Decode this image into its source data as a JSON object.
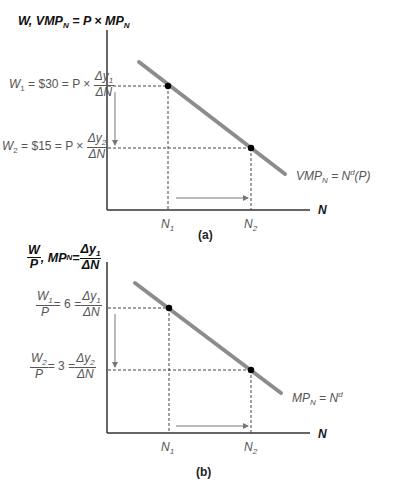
{
  "panel_a": {
    "y_axis_title": {
      "w": "W, VMP",
      "n_sub": "N",
      "eq": " = P × MP",
      "n_sub2": "N"
    },
    "w1_label": {
      "w": "W",
      "sub": "1",
      "rest": " = $30 = P × ",
      "num_a": "Δy",
      "num_sub": "1",
      "den": "ΔN"
    },
    "w2_label": {
      "w": "W",
      "sub": "2",
      "rest": " = $15 = P × ",
      "num_a": "Δy",
      "num_sub": "2",
      "den": "ΔN"
    },
    "curve_label": {
      "a": "VMP",
      "sub": "N",
      "b": " = N",
      "sup": "d",
      "c": "(P)"
    },
    "x_axis_label": "N",
    "n1": {
      "n": "N",
      "sub": "1"
    },
    "n2": {
      "n": "N",
      "sub": "2"
    },
    "caption": "(a)"
  },
  "panel_b": {
    "y_axis_title": {
      "frac_num": "W",
      "frac_den": "P",
      "mid": " , MP",
      "n_sub": "N",
      "eq": " = ",
      "num_a": "Δy",
      "num_sub": "1",
      "den": "ΔN"
    },
    "w1_label": {
      "frac_num_w": "W",
      "frac_num_sub": "1",
      "frac_den": "P",
      "rest": " = 6 = ",
      "num_a": "Δy",
      "num_sub": "1",
      "den": "ΔN"
    },
    "w2_label": {
      "frac_num_w": "W",
      "frac_num_sub": "2",
      "frac_den": "P",
      "rest": " = 3 = ",
      "num_a": "Δy",
      "num_sub": "2",
      "den": "ΔN"
    },
    "curve_label": {
      "a": "MP",
      "sub": "N",
      "b": " = N",
      "sup": "d"
    },
    "x_axis_label": "N",
    "n1": {
      "n": "N",
      "sub": "1"
    },
    "n2": {
      "n": "N",
      "sub": "2"
    },
    "caption": "(b)"
  },
  "colors": {
    "curve": "#8c8c8c",
    "axis": "#333333",
    "dash": "#444444",
    "arrow": "#777777",
    "point": "#000000"
  }
}
